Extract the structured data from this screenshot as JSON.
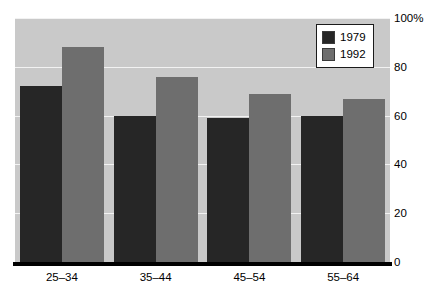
{
  "chart_data": {
    "type": "bar",
    "title": "",
    "xlabel": "",
    "ylabel": "",
    "categories": [
      "25–34",
      "35–44",
      "45–54",
      "55–64"
    ],
    "series": [
      {
        "name": "1979",
        "color": "#262626",
        "values": [
          72,
          60,
          59,
          60
        ]
      },
      {
        "name": "1992",
        "color": "#6e6e6e",
        "values": [
          88,
          76,
          69,
          67
        ]
      }
    ],
    "ylim": [
      0,
      100
    ],
    "yticks": [
      0,
      20,
      40,
      60,
      80,
      100
    ],
    "ytick_labels": [
      "0",
      "20",
      "40",
      "60",
      "80",
      "100%"
    ],
    "grid": true,
    "grid_axis": "y",
    "legend_position": "top-right",
    "axis_position": "right",
    "plot_background": "#c9c9c9",
    "grid_color": "#f2f2f2"
  },
  "legend": {
    "entries": [
      {
        "label": "1979"
      },
      {
        "label": "1992"
      }
    ]
  }
}
